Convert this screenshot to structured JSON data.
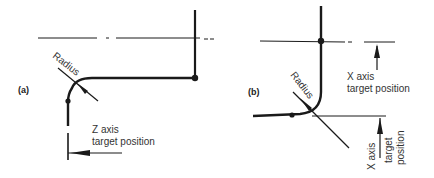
{
  "figure": {
    "panel_a": {
      "label": "(a)",
      "radius_label": "Radius",
      "axis_label_line1": "Z axis",
      "axis_label_line2": "target position"
    },
    "panel_b": {
      "label": "(b)",
      "radius_label": "Radius",
      "top_axis_label_line1": "X axis",
      "top_axis_label_line2": "target position",
      "rot_label_line1": "X axis",
      "rot_label_line2": "target",
      "rot_label_line3": "position"
    },
    "colors": {
      "line": "#1a1a1a",
      "text": "#333333"
    }
  }
}
